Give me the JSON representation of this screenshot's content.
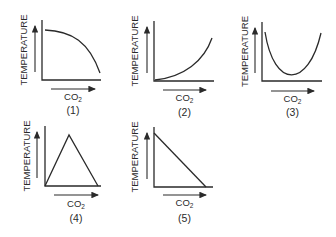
{
  "figure": {
    "y_axis_label": "TEMPERATURE",
    "x_axis_label": "CO",
    "x_axis_subscript": "2",
    "line_color": "#2a2a2a",
    "panels": [
      {
        "id": "1",
        "caption": "(1)",
        "shape": "concave-decreasing",
        "description": "starts high, decreases slowly then sharply"
      },
      {
        "id": "2",
        "caption": "(2)",
        "shape": "convex-increasing",
        "description": "starts low, increases slowly then sharply"
      },
      {
        "id": "3",
        "caption": "(3)",
        "shape": "u-shaped",
        "description": "high, falls to a minimum, rises again"
      },
      {
        "id": "4",
        "caption": "(4)",
        "shape": "peaked",
        "description": "rises linearly to a peak then falls linearly"
      },
      {
        "id": "5",
        "caption": "(5)",
        "shape": "linear-decreasing",
        "description": "straight line decreasing from high to zero"
      }
    ]
  }
}
